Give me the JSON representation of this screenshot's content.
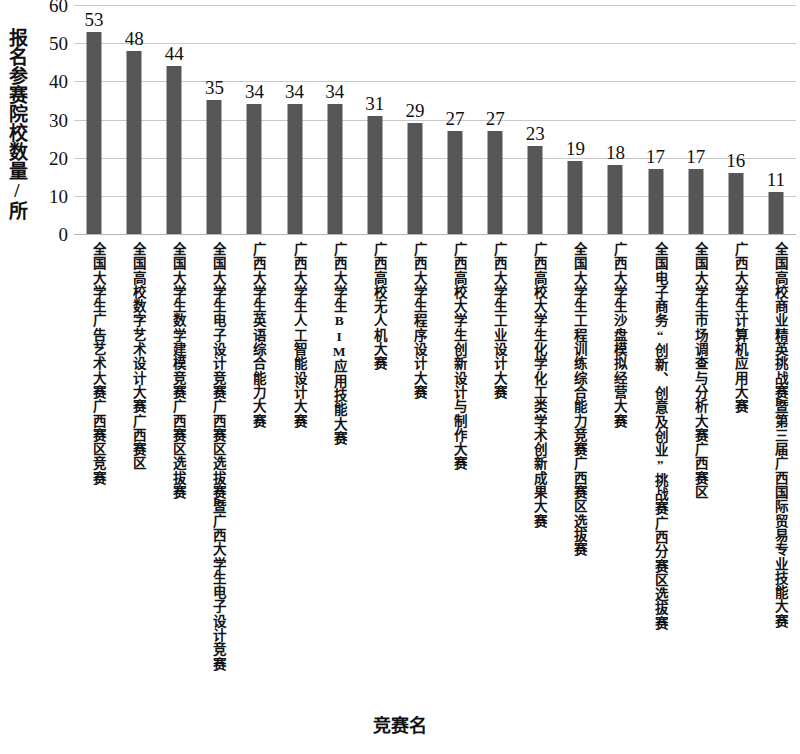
{
  "chart_data": {
    "type": "bar",
    "title": "",
    "xlabel": "竞赛名",
    "ylabel": "报名参赛院校数量/所",
    "ylim": [
      0,
      60
    ],
    "ytick_step": 10,
    "yticks": [
      0,
      10,
      20,
      30,
      40,
      50,
      60
    ],
    "grid": true,
    "legend": false,
    "bar_color": "#565656",
    "gridline_color": "#c9c9c9",
    "value_labels": true,
    "categories": [
      "全国大学生广告艺术大赛广西赛区竞赛",
      "全国高校数字艺术设计大赛广西赛区",
      "全国大学生数学建模竞赛广西赛区选拔赛",
      "全国大学生电子设计竞赛广西赛区选拔赛暨广西大学生电子设计竞赛",
      "广西大学生英语综合能力大赛",
      "广西大学生人工智能设计大赛",
      "广西大学生BIM应用技能大赛",
      "广西高校无人机大赛",
      "广西大学生程序设计大赛",
      "广西高校大学生创新设计与制作大赛",
      "广西大学生工业设计大赛",
      "广西高校大学生化学化工类学术创新成果大赛",
      "全国大学生工程训练综合能力竞赛广西赛区选拔赛",
      "广西大学生沙盘模拟经营大赛",
      "全国电子商务“创新、创意及创业”挑战赛广西分赛区选拔赛",
      "全国大学生市场调查与分析大赛广西赛区",
      "广西大学生计算机应用大赛",
      "全国高校商业精英挑战赛暨第三届广西国际贸易专业技能大赛"
    ],
    "values": [
      53,
      48,
      44,
      35,
      34,
      34,
      34,
      31,
      29,
      27,
      27,
      23,
      19,
      18,
      17,
      17,
      16,
      11
    ]
  }
}
